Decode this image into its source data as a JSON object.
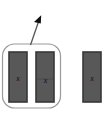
{
  "canvas": {
    "width": 110,
    "height": 113,
    "background": "#ffffff"
  },
  "diagram": {
    "title": "",
    "group": {
      "label": "",
      "x": 2.5,
      "y": 44,
      "width": 58,
      "height": 64,
      "corner_radius": 12,
      "stroke": "#9a9a9a",
      "stroke_width": 1.2,
      "fill": "none"
    },
    "blocks": [
      {
        "label": "x",
        "x": 9,
        "y": 52,
        "width": 18,
        "height": 50,
        "fill": "#585858",
        "stroke": "#383838",
        "stroke_width": 1.6,
        "marker_x": 18,
        "marker_y": 78,
        "in_group": true
      },
      {
        "label": "x",
        "x": 36,
        "y": 52,
        "width": 18,
        "height": 50,
        "fill": "#585858",
        "stroke": "#383838",
        "stroke_width": 1.6,
        "marker_x": 45,
        "marker_y": 80,
        "in_group": true
      },
      {
        "label": "x",
        "x": 83,
        "y": 52,
        "width": 18,
        "height": 50,
        "fill": "#585858",
        "stroke": "#383838",
        "stroke_width": 1.6,
        "marker_x": 92,
        "marker_y": 78,
        "in_group": false
      }
    ],
    "divider": {
      "x1": 36,
      "y1": 79,
      "x2": 54,
      "y2": 79,
      "stroke": "#4a4a4a",
      "stroke_width": 0.8
    },
    "arrow": {
      "label": "",
      "from_x": 30.5,
      "from_y": 45,
      "to_x": 41,
      "to_y": 15.5,
      "stroke": "#555555",
      "stroke_width": 1.3,
      "head_fill": "#101010",
      "head_size": 8
    }
  }
}
